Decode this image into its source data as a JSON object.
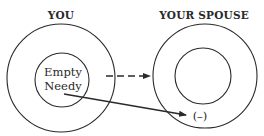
{
  "diagram": {
    "left": {
      "title": "YOU",
      "inner_text_line1": "Empty",
      "inner_text_line2": "Needy"
    },
    "right": {
      "title": "YOUR SPOUSE",
      "marker": "(–)"
    },
    "arrows": [
      {
        "from": "left-outer-circle",
        "to": "right-outer-circle",
        "style": "dashed"
      },
      {
        "from": "left-inner-circle",
        "to": "negative-marker",
        "style": "solid"
      }
    ],
    "colors": {
      "stroke": "#2a2a2a",
      "background": "#ffffff"
    }
  }
}
